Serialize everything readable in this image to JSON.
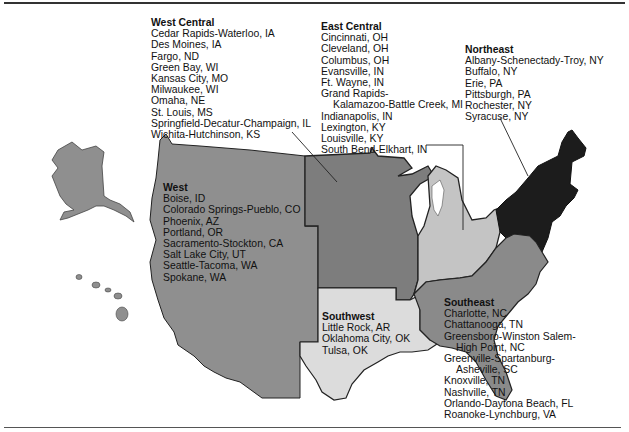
{
  "map": {
    "type": "regional map of the United States",
    "colors": {
      "west": "#8f8f8f",
      "west_central": "#7d7d7d",
      "east_central": "#c4c4c4",
      "northeast": "#1c1c1c",
      "southwest": "#dcdcdc",
      "southeast": "#8a8a8a",
      "border": "#222222"
    }
  },
  "regions": {
    "west_central": {
      "title": "West Central",
      "cities": [
        "Cedar Rapids-Waterloo, IA",
        "Des Moines, IA",
        "Fargo, ND",
        "Green Bay, WI",
        "Kansas City, MO",
        "Milwaukee, WI",
        "Omaha, NE",
        "St. Louis, MS",
        "Springfield-Decatur-Champaign, IL",
        "Wichita-Hutchinson, KS"
      ]
    },
    "east_central": {
      "title": "East Central",
      "cities": [
        "Cincinnati, OH",
        "Cleveland, OH",
        "Columbus, OH",
        "Evansville, IN",
        "Ft. Wayne, IN",
        "Grand Rapids-",
        "Kalamazoo-Battle Creek, MI",
        "Indianapolis, IN",
        "Lexington, KY",
        "Louisville, KY",
        "South Bend-Elkhart, IN"
      ]
    },
    "northeast": {
      "title": "Northeast",
      "cities": [
        "Albany-Schenectady-Troy, NY",
        "Buffalo, NY",
        "Erie, PA",
        "Pittsburgh, PA",
        "Rochester, NY",
        "Syracuse, NY"
      ]
    },
    "west": {
      "title": "West",
      "cities": [
        "Boise, ID",
        "Colorado Springs-Pueblo, CO",
        "Phoenix, AZ",
        "Portland, OR",
        "Sacramento-Stockton, CA",
        "Salt Lake City, UT",
        "Seattle-Tacoma, WA",
        "Spokane, WA"
      ]
    },
    "southwest": {
      "title": "Southwest",
      "cities": [
        "Little Rock, AR",
        "Oklahoma City, OK",
        "Tulsa, OK"
      ]
    },
    "southeast": {
      "title": "Southeast",
      "cities": [
        "Charlotte, NC",
        "Chattanooga, TN",
        "Greensboro-Winston Salem-",
        "High Point, NC",
        "Greenville-Spartanburg-",
        "Asheville, SC",
        "Knoxville, TN",
        "Nashville, TN",
        "Orlando-Daytona Beach, FL",
        "Roanoke-Lynchburg, VA"
      ]
    }
  }
}
